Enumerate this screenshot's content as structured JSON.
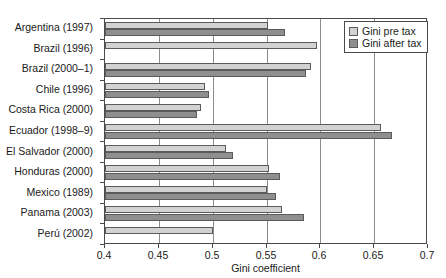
{
  "chart_data": {
    "type": "bar",
    "orientation": "horizontal",
    "title": "",
    "xlabel": "Gini coefficient",
    "ylabel": "",
    "xlim": [
      0.4,
      0.7
    ],
    "xticks": [
      0.4,
      0.45,
      0.5,
      0.55,
      0.6,
      0.65,
      0.7
    ],
    "xtick_labels": [
      "0.4",
      "0.45",
      "0.5",
      "0.55",
      "0.6",
      "0.65",
      "0.7"
    ],
    "grid": true,
    "grid_axis": "x",
    "legend_position": "top-right",
    "categories": [
      "Argentina (1997)",
      "Brazil (1996)",
      "Brazil (2000–1)",
      "Chile (1996)",
      "Costa Rica (2000)",
      "Ecuador (1998–9)",
      "El Salvador (2000)",
      "Honduras (2000)",
      "Mexico (1989)",
      "Panama (2003)",
      "Perú (2002)"
    ],
    "series": [
      {
        "name": "Gini pre tax",
        "color": "#d2d2d2",
        "values": [
          0.551,
          0.597,
          0.591,
          0.493,
          0.489,
          0.656,
          0.512,
          0.552,
          0.55,
          0.564,
          0.5
        ]
      },
      {
        "name": "Gini after tax",
        "color": "#8f8f8f",
        "values": [
          0.567,
          null,
          0.587,
          0.497,
          0.485,
          0.667,
          0.519,
          0.563,
          0.559,
          0.585,
          null
        ]
      }
    ]
  },
  "legend": {
    "items": [
      {
        "label": "Gini pre tax",
        "swatch": "pre"
      },
      {
        "label": "Gini after tax",
        "swatch": "after"
      }
    ]
  },
  "axis": {
    "x_title": "Gini coefficient"
  },
  "caption": {
    "text": ""
  }
}
